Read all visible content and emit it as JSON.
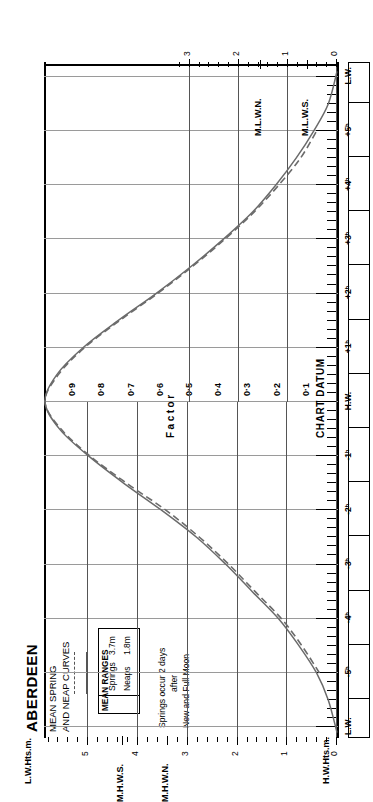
{
  "title": {
    "port": "ABERDEEN",
    "line1": "MEAN SPRING",
    "line2": "AND NEAP CURVES"
  },
  "legend": {
    "heading": "MEAN RANGES",
    "rows": [
      {
        "name": "Springs",
        "value": "3.7m",
        "style": "solid"
      },
      {
        "name": "Neaps",
        "value": "1.8m",
        "style": "dashed"
      }
    ]
  },
  "note": {
    "line1": "Springs occur 2 days",
    "line2": "after",
    "line3": "New and Full Moon"
  },
  "datum_label": "CHART DATUM",
  "axes": {
    "left": {
      "title": "H.W.Hts.m.",
      "ticks": [
        "0",
        "1",
        "2",
        "3",
        "4",
        "5"
      ],
      "markers": [
        {
          "label": "M.H.W.S.",
          "value": 4.3
        },
        {
          "label": "M.H.W.N.",
          "value": 3.4
        }
      ]
    },
    "right": {
      "title": "L.W.Hts.m.",
      "ticks": [
        "0",
        "1",
        "2",
        "3"
      ],
      "markers": [
        {
          "label": "M.L.W.N.",
          "value": 1.55
        },
        {
          "label": "M.L.W.S.",
          "value": 0.6
        }
      ]
    },
    "time": {
      "labels": [
        "L.W.",
        "+5ʰ",
        "+4ʰ",
        "+3ʰ",
        "+2ʰ",
        "+1ʰ",
        "H.W.",
        "-1ʰ",
        "-2ʰ",
        "-3ʰ",
        "-4ʰ",
        "-5ʰ",
        "L.W."
      ],
      "hw_label": "H.W.",
      "lw_label": "L.W."
    },
    "factor": {
      "title": "Factor",
      "ticks": [
        "0·9",
        "0·8",
        "0·7",
        "0·6",
        "0·5",
        "0·4",
        "0·3",
        "0·2",
        "0·1"
      ]
    }
  },
  "colors": {
    "curve": "#6b6b6b",
    "grid": "#9a9a9a",
    "grid_major": "#555555",
    "frame": "#000000",
    "background": "#ffffff"
  },
  "chart_data": {
    "type": "line",
    "title": "ABERDEEN MEAN SPRING AND NEAP CURVES",
    "subtitle": "Tidal curve — factor vs. time relative to High Water",
    "xlabel": "Factor",
    "ylabel": "Hours relative to High Water",
    "xlim": [
      0,
      1
    ],
    "ylim": [
      -6.2,
      6.2
    ],
    "grid": true,
    "legend_position": "top-left",
    "notes": [
      "Springs occur 2 days after New and Full Moon"
    ],
    "mean_ranges": {
      "springs_m": 3.7,
      "neaps_m": 1.8
    },
    "height_scales": {
      "hw_heights_m": [
        0,
        1,
        2,
        3,
        4,
        5
      ],
      "lw_heights_m": [
        0,
        1,
        2,
        3
      ],
      "mhws_m": 4.3,
      "mhwn_m": 3.4,
      "mlwn_m": 1.55,
      "mlws_m": 0.6
    },
    "series": [
      {
        "name": "Springs",
        "style": "solid",
        "hours": [
          -6.1,
          -5.5,
          -5.0,
          -4.5,
          -4.0,
          -3.5,
          -3.0,
          -2.5,
          -2.0,
          -1.5,
          -1.0,
          -0.5,
          0.0,
          0.5,
          1.0,
          1.5,
          2.0,
          2.5,
          3.0,
          3.5,
          4.0,
          4.5,
          5.0,
          5.5,
          6.1
        ],
        "factor": [
          0.0,
          0.03,
          0.07,
          0.13,
          0.2,
          0.29,
          0.38,
          0.48,
          0.6,
          0.73,
          0.85,
          0.95,
          1.0,
          0.96,
          0.87,
          0.75,
          0.62,
          0.5,
          0.39,
          0.29,
          0.21,
          0.14,
          0.08,
          0.03,
          0.0
        ]
      },
      {
        "name": "Neaps",
        "style": "dashed",
        "hours": [
          -5.0,
          -4.5,
          -4.0,
          -3.5,
          -3.0,
          -2.5,
          -2.0,
          -1.5,
          -1.0,
          -0.5,
          0.0,
          0.5,
          1.0,
          1.5,
          2.0,
          2.5,
          3.0,
          3.5,
          4.0,
          4.5,
          5.0
        ],
        "factor": [
          0.06,
          0.12,
          0.19,
          0.28,
          0.37,
          0.47,
          0.585,
          0.72,
          0.845,
          0.945,
          1.0,
          0.955,
          0.865,
          0.745,
          0.615,
          0.495,
          0.385,
          0.285,
          0.2,
          0.125,
          0.07
        ]
      }
    ]
  }
}
